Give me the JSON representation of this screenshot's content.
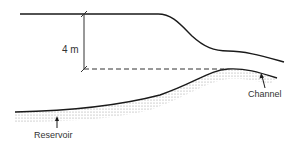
{
  "diagram": {
    "dimension_label": "4 m",
    "labels": {
      "reservoir": "Reservoir",
      "channel": "Channel"
    },
    "colors": {
      "line": "#1a1a1a",
      "stipple": "#9a9a9a",
      "text": "#333333"
    }
  }
}
